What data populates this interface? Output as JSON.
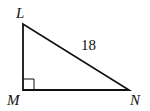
{
  "diagram": {
    "type": "right-triangle",
    "vertices": [
      {
        "label": "L",
        "x": 23,
        "y": 24
      },
      {
        "label": "M",
        "x": 23,
        "y": 90
      },
      {
        "label": "N",
        "x": 129,
        "y": 90
      }
    ],
    "right_angle_at": "M",
    "side_labels": [
      {
        "side": "LN",
        "text": "18"
      }
    ],
    "stroke_color": "#111111"
  }
}
